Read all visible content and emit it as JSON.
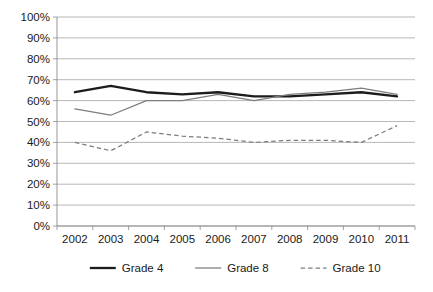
{
  "chart_data": {
    "type": "line",
    "title": "",
    "subtitle": "",
    "xlabel": "",
    "ylabel": "",
    "categories": [
      "2002",
      "2003",
      "2004",
      "2005",
      "2006",
      "2007",
      "2008",
      "2009",
      "2010",
      "2011"
    ],
    "series": [
      {
        "name": "Grade 4",
        "values": [
          64,
          67,
          64,
          63,
          64,
          62,
          62,
          63,
          64,
          62
        ],
        "style": "solid-thick",
        "color": "#1c1c1c"
      },
      {
        "name": "Grade 8",
        "values": [
          56,
          53,
          60,
          60,
          63,
          60,
          63,
          64,
          66,
          63
        ],
        "style": "solid-thin",
        "color": "#7d7d7d"
      },
      {
        "name": "Grade 10",
        "values": [
          40,
          36,
          45,
          43,
          42,
          40,
          41,
          41,
          40,
          48
        ],
        "style": "dashed",
        "color": "#7d7d7d"
      }
    ],
    "ylim": [
      0,
      100
    ],
    "ytick_values": [
      0,
      10,
      20,
      30,
      40,
      50,
      60,
      70,
      80,
      90,
      100
    ],
    "ytick_labels": [
      "0%",
      "10%",
      "20%",
      "30%",
      "40%",
      "50%",
      "60%",
      "70%",
      "80%",
      "90%",
      "100%"
    ],
    "grid": true,
    "grid_axis": "y",
    "legend_position": "bottom",
    "legend_entries": [
      "Grade 4",
      "Grade 8",
      "Grade 10"
    ]
  },
  "axes": {
    "y_axis_name": "percent-axis",
    "x_axis_name": "year-axis"
  }
}
